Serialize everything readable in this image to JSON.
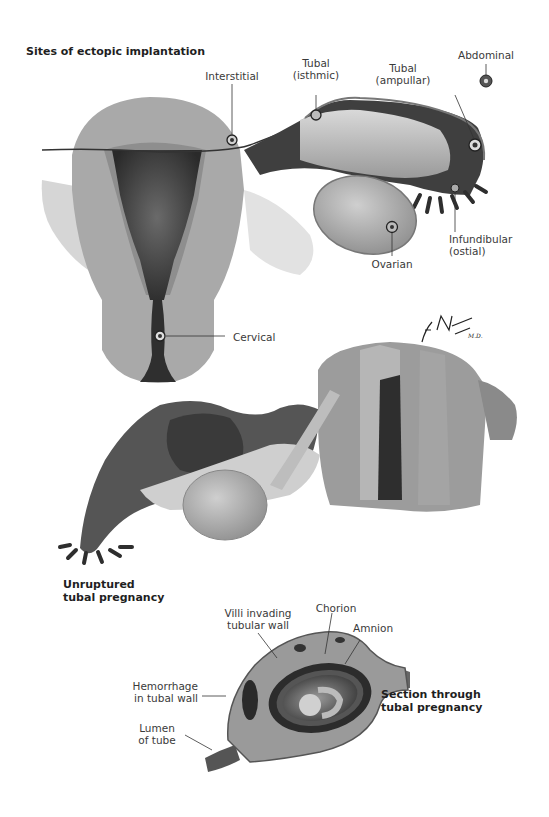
{
  "figure": {
    "panels": [
      {
        "id": "sites",
        "title": "Sites of ectopic implantation",
        "labels": {
          "interstitial": "Interstitial",
          "tubal_isthmic_1": "Tubal",
          "tubal_isthmic_2": "(isthmic)",
          "tubal_ampullar_1": "Tubal",
          "tubal_ampullar_2": "(ampullar)",
          "abdominal": "Abdominal",
          "infundibular_1": "Infundibular",
          "infundibular_2": "(ostial)",
          "ovarian": "Ovarian",
          "cervical": "Cervical"
        }
      },
      {
        "id": "unruptured",
        "title_line1": "Unruptured",
        "title_line2": "tubal pregnancy"
      },
      {
        "id": "section",
        "title_line1": "Section through",
        "title_line2": "tubal pregnancy",
        "labels": {
          "villi_1": "Villi invading",
          "villi_2": "tubular wall",
          "chorion": "Chorion",
          "amnion": "Amnion",
          "hemorrhage_1": "Hemorrhage",
          "hemorrhage_2": "in tubal wall",
          "lumen_1": "Lumen",
          "lumen_2": "of tube"
        }
      }
    ],
    "signature": "F. Netter M.D."
  }
}
